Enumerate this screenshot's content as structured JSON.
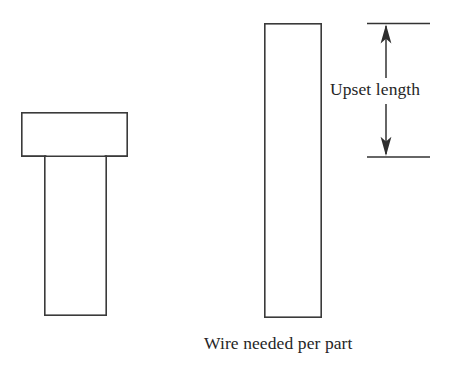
{
  "figure": {
    "background_color": "#ffffff",
    "line_color": "#3a3a3a",
    "text_color": "#262626",
    "width": 462,
    "height": 366
  },
  "finished_part": {
    "name": "Upset headed part",
    "head": {
      "x": 21,
      "y": 112,
      "width": 107,
      "height": 45
    },
    "shank": {
      "x": 44,
      "y": 157,
      "width": 63,
      "height": 159
    }
  },
  "wire_stock": {
    "name": "Wire stock blank",
    "body": {
      "x": 264,
      "y": 23,
      "width": 58,
      "height": 295
    }
  },
  "dimension": {
    "label": "Upset length",
    "top_line_y": 23,
    "bottom_line_y": 157,
    "line_x_start": 367,
    "line_x_end": 430,
    "arrow_x": 386,
    "arrow_direction_top": "up",
    "arrow_direction_bottom": "down"
  },
  "caption": {
    "text": "Wire needed per part"
  }
}
